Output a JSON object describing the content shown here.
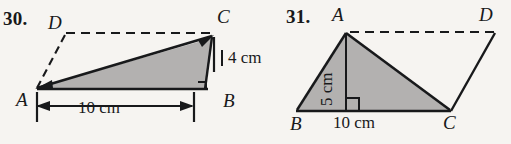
{
  "page": {
    "background_color": "#f6f4f1",
    "ink_color": "#18191b",
    "fill_color": "#b3b1b0"
  },
  "problems": [
    {
      "number": "30.",
      "figure": "parallelogram-ABCD-with-shaded-triangle-ABC",
      "vertex_labels": {
        "A": "A",
        "B": "B",
        "C": "C",
        "D": "D"
      },
      "dimensions": {
        "height": "4 cm",
        "base": "10 cm"
      },
      "marks": {
        "right_angle": "right-angle-at-B"
      }
    },
    {
      "number": "31.",
      "figure": "parallelogram-ABDC-with-shaded-triangle-ABC",
      "vertex_labels": {
        "A": "A",
        "B": "B",
        "C": "C",
        "D": "D"
      },
      "dimensions": {
        "height": "5 cm",
        "base": "10 cm"
      },
      "marks": {
        "right_angle": "right-angle-at-foot-of-altitude"
      }
    }
  ]
}
